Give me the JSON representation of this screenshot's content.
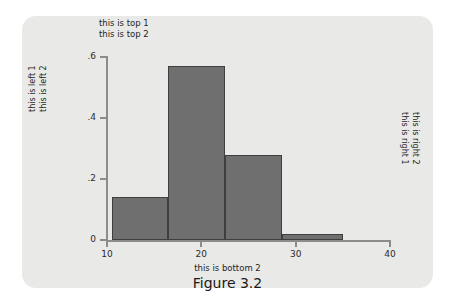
{
  "figure": {
    "caption": "Figure 3.2",
    "card_color": "#e9e9e7",
    "page_background": "#ffffff"
  },
  "annotations": {
    "top_line_1": "this is top 1",
    "top_line_2": "this is top 2",
    "left_line_1": "this is left 1",
    "left_line_2": "this is left 2",
    "right_line_1": "this is right 2",
    "right_line_2": "this is right 1",
    "bottom_label": "this is bottom 2"
  },
  "chart_data": {
    "type": "bar",
    "title": "this is top 1",
    "subtitle": "this is top 2",
    "xlabel": "this is bottom 2",
    "ylabel": "this is left 1",
    "ylabel_2": "this is left 2",
    "right_label_1": "this is right 2",
    "right_label_2": "this is right 1",
    "histogram": true,
    "bin_edges": [
      10.5,
      16.5,
      22.5,
      28.5,
      35.0
    ],
    "categories": [
      "10.5-16.5",
      "16.5-22.5",
      "22.5-28.5",
      "28.5-35.0"
    ],
    "values": [
      0.14,
      0.57,
      0.28,
      0.02
    ],
    "xlim": [
      10,
      40
    ],
    "ylim": [
      0,
      0.6
    ],
    "xticks": [
      10,
      20,
      30,
      40
    ],
    "xtick_labels": [
      "10",
      "20",
      "30",
      "40"
    ],
    "yticks": [
      0,
      0.2,
      0.4,
      0.6
    ],
    "ytick_labels": [
      "0",
      ".2",
      ".4",
      ".6"
    ],
    "grid": false,
    "legend": false,
    "bar_color": "#706f6f",
    "bar_edge_color": "#3f3f3f",
    "axis_color": "#8c8c8a"
  }
}
